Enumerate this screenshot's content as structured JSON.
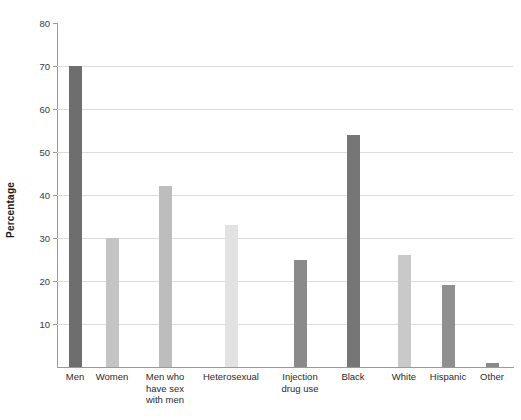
{
  "chart_data": {
    "type": "bar",
    "title": "",
    "subtitle": "",
    "xlabel": "",
    "ylabel": "Percentage",
    "ylim": [
      0,
      80
    ],
    "ytick_interval": 10,
    "yticks": [
      10,
      20,
      30,
      40,
      50,
      60,
      70,
      80
    ],
    "ytick_labels": [
      "10",
      "20",
      "30",
      "40",
      "50",
      "60",
      "70",
      "80"
    ],
    "grid": true,
    "legend": "none",
    "categories": [
      "Men",
      "Women",
      "Men who have sex with men",
      "Heterosexual",
      "Injection drug use",
      "Black",
      "White",
      "Hispanic",
      "Other"
    ],
    "category_label_lines": [
      [
        "Men"
      ],
      [
        "Women"
      ],
      [
        "Men who",
        "have sex",
        "with men"
      ],
      [
        "Heterosexual"
      ],
      [
        "Injection",
        "drug use"
      ],
      [
        "Black"
      ],
      [
        "White"
      ],
      [
        "Hispanic"
      ],
      [
        "Other"
      ]
    ],
    "values": [
      70,
      30,
      42,
      33,
      25,
      54,
      26,
      19,
      1
    ],
    "bar_colors": [
      "#6e6e6e",
      "#c4c4c4",
      "#bdbdbd",
      "#e2e2e2",
      "#8a8a8a",
      "#767676",
      "#c9c9c9",
      "#8f8f8f",
      "#8a8a8a"
    ],
    "bar_centers_px": [
      75,
      112,
      165,
      231,
      300,
      353,
      404,
      448,
      492
    ],
    "bar_width_px": 13,
    "axis_color": "#9a9a9a",
    "grid_color": "#dcdcdc",
    "background": "#ffffff"
  }
}
